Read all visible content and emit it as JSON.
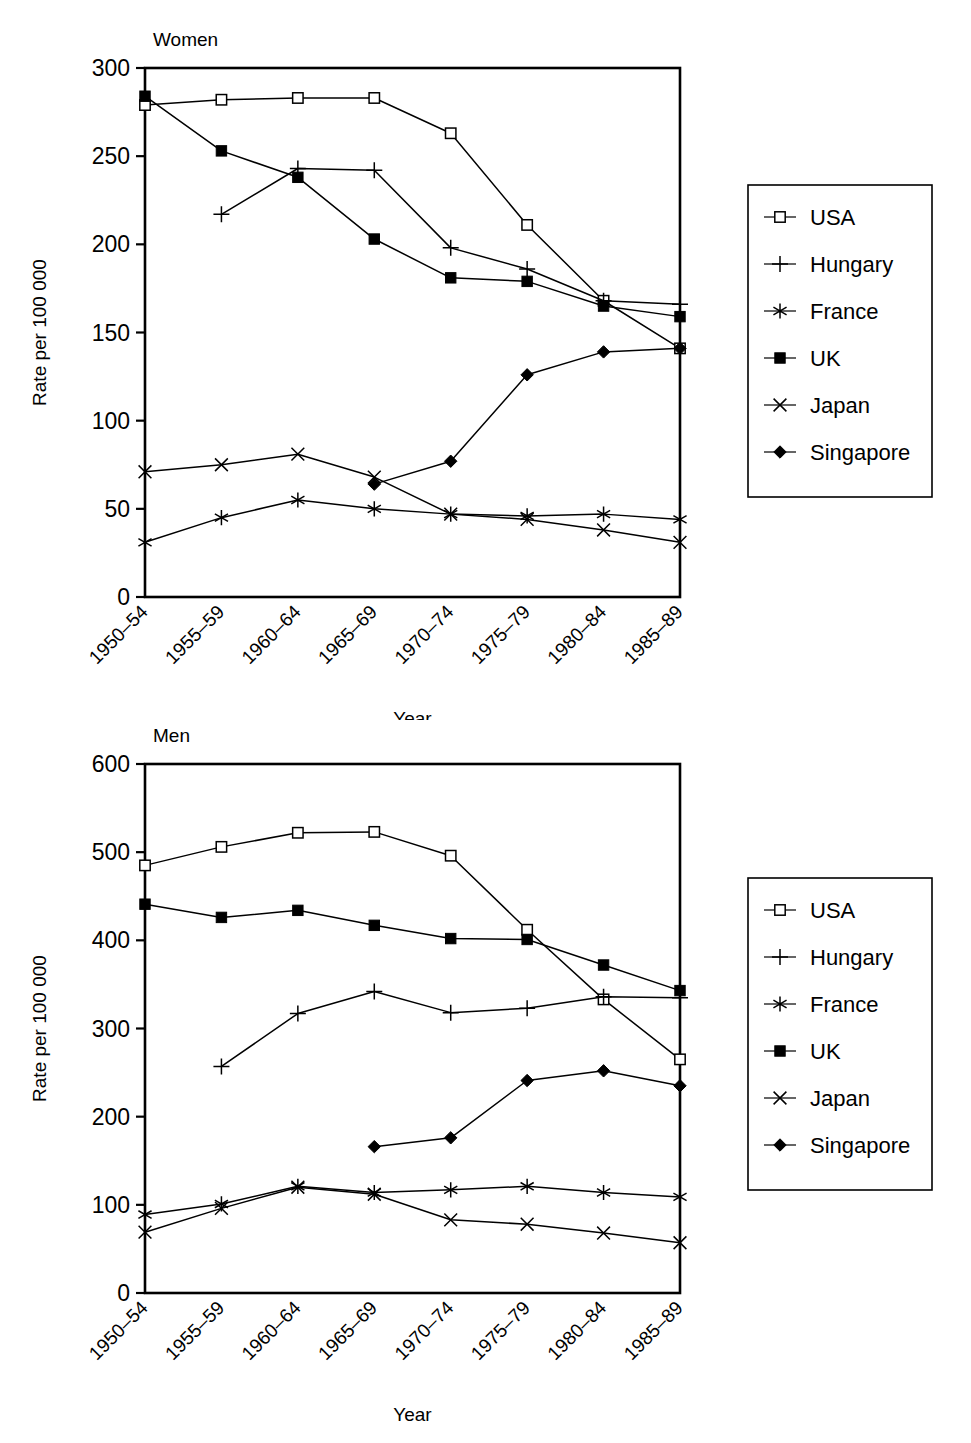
{
  "figure": {
    "panels": [
      "women",
      "men"
    ],
    "legend_entries": [
      "USA",
      "Hungary",
      "France",
      "UK",
      "Japan",
      "Singapore"
    ]
  },
  "chart_data": [
    {
      "type": "line",
      "title": "Women",
      "xlabel": "Year",
      "ylabel": "Rate per 100 000",
      "ylim": [
        0,
        300
      ],
      "yticks": [
        0,
        50,
        100,
        150,
        200,
        250,
        300
      ],
      "ytick_labels": [
        "0",
        "50",
        "100",
        "150",
        "200",
        "250",
        "300"
      ],
      "grid": false,
      "legend_position": "right-outside",
      "categories": [
        "1950–54",
        "1955–59",
        "1960–64",
        "1965–69",
        "1970–74",
        "1975–79",
        "1980–84",
        "1985–89"
      ],
      "series": [
        {
          "name": "USA",
          "marker": "open-square",
          "values": [
            279,
            282,
            283,
            283,
            263,
            211,
            168,
            141
          ]
        },
        {
          "name": "Hungary",
          "marker": "plus",
          "values": [
            null,
            217,
            243,
            242,
            198,
            186,
            168,
            166
          ]
        },
        {
          "name": "France",
          "marker": "asterisk",
          "values": [
            31,
            45,
            55,
            50,
            47,
            46,
            47,
            44
          ]
        },
        {
          "name": "UK",
          "marker": "solid-square",
          "values": [
            284,
            253,
            238,
            203,
            181,
            179,
            165,
            159
          ]
        },
        {
          "name": "Japan",
          "marker": "cross",
          "values": [
            71,
            75,
            81,
            68,
            47,
            44,
            38,
            31
          ]
        },
        {
          "name": "Singapore",
          "marker": "solid-diamond",
          "values": [
            null,
            null,
            null,
            64,
            77,
            126,
            139,
            141
          ]
        }
      ]
    },
    {
      "type": "line",
      "title": "Men",
      "xlabel": "Year",
      "ylabel": "Rate per 100 000",
      "ylim": [
        0,
        600
      ],
      "yticks": [
        0,
        100,
        200,
        300,
        400,
        500,
        600
      ],
      "ytick_labels": [
        "0",
        "100",
        "200",
        "300",
        "400",
        "500",
        "600"
      ],
      "grid": false,
      "legend_position": "right-outside",
      "categories": [
        "1950–54",
        "1955–59",
        "1960–64",
        "1965–69",
        "1970–74",
        "1975–79",
        "1980–84",
        "1985–89"
      ],
      "series": [
        {
          "name": "USA",
          "marker": "open-square",
          "values": [
            485,
            506,
            522,
            523,
            496,
            412,
            333,
            265
          ]
        },
        {
          "name": "Hungary",
          "marker": "plus",
          "values": [
            null,
            257,
            317,
            342,
            318,
            323,
            336,
            335
          ]
        },
        {
          "name": "France",
          "marker": "asterisk",
          "values": [
            89,
            101,
            121,
            114,
            117,
            121,
            114,
            109
          ]
        },
        {
          "name": "UK",
          "marker": "solid-square",
          "values": [
            441,
            426,
            434,
            417,
            402,
            401,
            372,
            343
          ]
        },
        {
          "name": "Japan",
          "marker": "cross",
          "values": [
            69,
            96,
            120,
            112,
            83,
            78,
            68,
            57
          ]
        },
        {
          "name": "Singapore",
          "marker": "solid-diamond",
          "values": [
            null,
            null,
            null,
            166,
            176,
            241,
            252,
            235
          ]
        }
      ]
    }
  ]
}
